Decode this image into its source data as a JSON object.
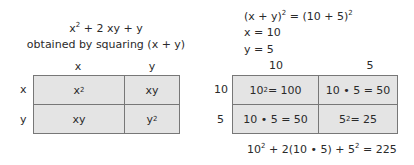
{
  "left": {
    "expression": {
      "base1": "x",
      "exp1": "2",
      "rest": " + 2 xy + y"
    },
    "caption": "obtained by squaring (x + y)",
    "col_headers": [
      "x",
      "y"
    ],
    "row_headers": [
      "x",
      "y"
    ],
    "cells": [
      [
        {
          "base": "x",
          "exp": "2"
        },
        {
          "base": "xy",
          "exp": ""
        }
      ],
      [
        {
          "base": "xy",
          "exp": ""
        },
        {
          "base": "y",
          "exp": "2"
        }
      ]
    ]
  },
  "right": {
    "equation": {
      "lhs": "(x + y)",
      "lhs_exp": "2",
      "mid": " = (10 + 5)",
      "rhs_exp": "2"
    },
    "x_def": "x = 10",
    "y_def": "y = 5",
    "col_headers": [
      "10",
      "5"
    ],
    "row_headers": [
      "10",
      "5"
    ],
    "cells": [
      [
        {
          "pre": "10",
          "exp": "2",
          "post": " = 100"
        },
        {
          "pre": "10 • 5 = 50",
          "exp": "",
          "post": ""
        }
      ],
      [
        {
          "pre": "10 • 5 = 50",
          "exp": "",
          "post": ""
        },
        {
          "pre": "5",
          "exp": "2",
          "post": " = 25"
        }
      ]
    ],
    "result": {
      "a": "10",
      "a_exp": "2",
      "b": " + 2(10 • 5) + 5",
      "b_exp": "2",
      "c": " = 225"
    }
  }
}
